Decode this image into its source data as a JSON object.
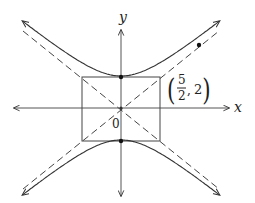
{
  "figure": {
    "type": "hyperbola-diagram",
    "equation": "y^2/4 - x^2/(25/4) = 1",
    "axes": {
      "x_label": "x",
      "y_label": "y",
      "origin_label": "0"
    },
    "rectangle_corner_label": {
      "open": "(",
      "numerator": "5",
      "denominator": "2",
      "sep": ",",
      "second": "2",
      "close": ")"
    },
    "vertices": [
      [
        0,
        2
      ],
      [
        0,
        -2
      ]
    ],
    "asymptotes": [
      "y = (4/5)x",
      "y = -(4/5)x"
    ],
    "reference_box": {
      "x_half": 2.5,
      "y_half": 2
    },
    "marked_point_on_curve": "upper-right branch",
    "colors": {
      "stroke": "#333333",
      "dot": "#111111"
    }
  }
}
